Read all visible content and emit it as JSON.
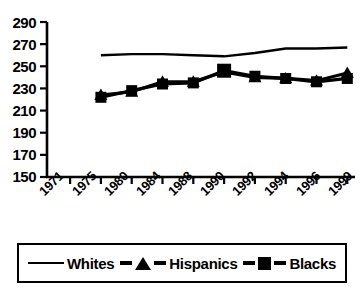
{
  "chart_data": {
    "type": "line",
    "title": "",
    "xlabel": "",
    "ylabel": "",
    "x": [
      "1971",
      "1975",
      "1980",
      "1984",
      "1988",
      "1990",
      "1992",
      "1994",
      "1996",
      "1999"
    ],
    "categories": [
      "1971",
      "1975",
      "1980",
      "1984",
      "1988",
      "1990",
      "1992",
      "1994",
      "1996",
      "1999"
    ],
    "ylim": [
      150,
      290
    ],
    "yticks": [
      150,
      170,
      190,
      210,
      230,
      250,
      270,
      290
    ],
    "ytick_labels": [
      "150",
      "170",
      "190",
      "210",
      "230",
      "250",
      "270",
      "290"
    ],
    "grid": false,
    "legend_position": "bottom",
    "series": [
      {
        "name": "Whites",
        "marker": "none",
        "color": "#000000",
        "values": [
          null,
          260,
          261,
          261,
          260,
          259,
          262,
          266,
          266,
          267
        ]
      },
      {
        "name": "Hispanics",
        "marker": "triangle",
        "color": "#000000",
        "values": [
          null,
          224,
          227,
          236,
          236,
          245,
          240,
          239,
          237,
          244
        ]
      },
      {
        "name": "Blacks",
        "marker": "square",
        "color": "#000000",
        "values": [
          null,
          222,
          228,
          234,
          235,
          246,
          241,
          239,
          236,
          239
        ]
      }
    ]
  },
  "legend": {
    "items": [
      {
        "label": "Whites",
        "marker": "line-marker"
      },
      {
        "label": "Hispanics",
        "marker": "triangle-marker"
      },
      {
        "label": "Blacks",
        "marker": "square-marker"
      }
    ]
  }
}
